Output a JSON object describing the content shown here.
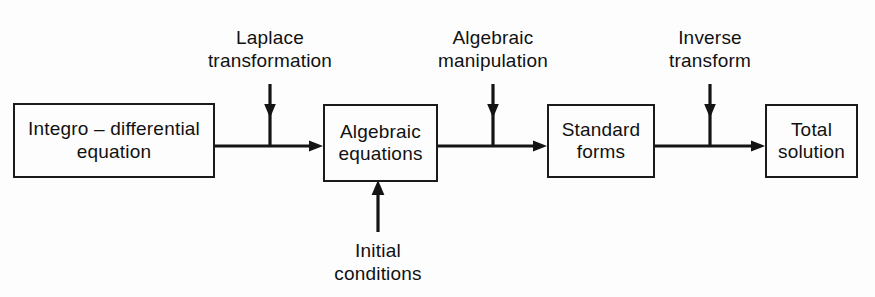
{
  "diagram": {
    "line_color": "#141414",
    "box_border_color": "#1b1b1b",
    "background_color": "#fdfdfd",
    "text_color": "#111111",
    "blocks": [
      {
        "id": "integro-differential-equation",
        "line1": "Integro – differential",
        "line2": "equation"
      },
      {
        "id": "algebraic-equations",
        "line1": "Algebraic",
        "line2": "equations"
      },
      {
        "id": "standard-forms",
        "line1": "Standard",
        "line2": "forms"
      },
      {
        "id": "total-solution",
        "line1": "Total",
        "line2": "solution"
      }
    ],
    "annotations": [
      {
        "id": "laplace-transformation",
        "line1": "Laplace",
        "line2": "transformation",
        "direction": "down"
      },
      {
        "id": "algebraic-manipulation",
        "line1": "Algebraic",
        "line2": "manipulation",
        "direction": "down"
      },
      {
        "id": "inverse-transform",
        "line1": "Inverse",
        "line2": "transform",
        "direction": "down"
      },
      {
        "id": "initial-conditions",
        "line1": "Initial",
        "line2": "conditions",
        "direction": "up"
      }
    ]
  }
}
